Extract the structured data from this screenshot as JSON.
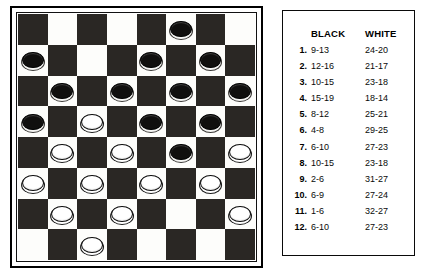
{
  "board": {
    "columns": 8,
    "rows": 8,
    "light_square_color": "#fdfdfb",
    "dark_square_color": "#2a2724",
    "black_piece_color": "#100f0e",
    "white_piece_color": "#ffffff",
    "squares": [
      [
        "dark",
        "light",
        "dark",
        "light",
        "dark",
        "light",
        "dark",
        "light"
      ],
      [
        "light",
        "dark",
        "light",
        "dark",
        "light",
        "dark",
        "light",
        "dark"
      ],
      [
        "dark",
        "light",
        "dark",
        "light",
        "dark",
        "light",
        "dark",
        "light"
      ],
      [
        "light",
        "dark",
        "light",
        "dark",
        "light",
        "dark",
        "light",
        "dark"
      ],
      [
        "dark",
        "light",
        "dark",
        "light",
        "dark",
        "light",
        "dark",
        "light"
      ],
      [
        "light",
        "dark",
        "light",
        "dark",
        "light",
        "dark",
        "light",
        "dark"
      ],
      [
        "dark",
        "light",
        "dark",
        "light",
        "dark",
        "light",
        "dark",
        "light"
      ],
      [
        "light",
        "dark",
        "light",
        "dark",
        "light",
        "dark",
        "light",
        "dark"
      ]
    ],
    "pieces": [
      [
        "",
        "",
        "",
        "",
        "",
        "black",
        "",
        ""
      ],
      [
        "black",
        "",
        "",
        "",
        "black",
        "",
        "black",
        ""
      ],
      [
        "",
        "black",
        "",
        "black",
        "",
        "black",
        "",
        "black"
      ],
      [
        "black",
        "",
        "white",
        "",
        "black",
        "",
        "black",
        ""
      ],
      [
        "",
        "white",
        "",
        "white",
        "",
        "black",
        "",
        "white"
      ],
      [
        "white",
        "",
        "white",
        "",
        "white",
        "",
        "white",
        ""
      ],
      [
        "",
        "white",
        "",
        "white",
        "",
        "",
        "",
        "white"
      ],
      [
        "",
        "",
        "white",
        "",
        "",
        "",
        "",
        ""
      ]
    ]
  },
  "moves_panel": {
    "header": {
      "black_label": "BLACK",
      "white_label": "WHITE"
    },
    "rows": [
      {
        "number": "1.",
        "black": "9-13",
        "white": "24-20"
      },
      {
        "number": "2.",
        "black": "12-16",
        "white": "21-17"
      },
      {
        "number": "3.",
        "black": "10-15",
        "white": "23-18"
      },
      {
        "number": "4.",
        "black": "15-19",
        "white": "18-14"
      },
      {
        "number": "5.",
        "black": "8-12",
        "white": "25-21"
      },
      {
        "number": "6.",
        "black": "4-8",
        "white": "29-25"
      },
      {
        "number": "7.",
        "black": "6-10",
        "white": "27-23"
      },
      {
        "number": "8.",
        "black": "10-15",
        "white": "23-18"
      },
      {
        "number": "9.",
        "black": "2-6",
        "white": "31-27"
      },
      {
        "number": "10.",
        "black": "6-9",
        "white": "27-24"
      },
      {
        "number": "11.",
        "black": "1-6",
        "white": "32-27"
      },
      {
        "number": "12.",
        "black": "6-10",
        "white": "27-23"
      }
    ]
  }
}
